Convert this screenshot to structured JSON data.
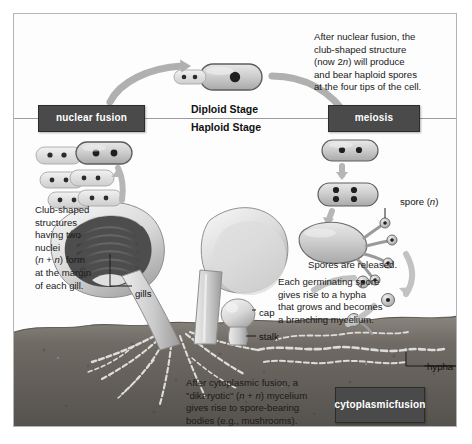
{
  "figure": {
    "frame_color": "#b4b4b4",
    "box_color": "#4a4a4a",
    "soil_color": "#6e6a66"
  },
  "stages": {
    "diploid": "Diploid Stage",
    "haploid": "Haploid Stage"
  },
  "boxes": {
    "nuclear_fusion": "nuclear fusion",
    "meiosis": "meiosis",
    "cytoplasmic_fusion_line1": "cytoplasmic",
    "cytoplasmic_fusion_line2": "fusion"
  },
  "captions": {
    "nuclear_fusion": "After nuclear fusion, the\nclub-shaped structure\n(now 2n) will produce\nand bear haploid spores\nat the four tips of the cell.",
    "club_shaped": "Club-shaped\nstructures\nhaving two\nnuclei\n(n + n) form\nat the margin\nof each gill.",
    "spores_released": "Spores are released.",
    "germinating_spore": "Each germinating spore\ngives rise to a hypha\nthat grows and becomes\na  branching mycelium.",
    "cytoplasmic_fusion": "After cytoplasmic fusion, a\n\"dikaryotic\" (n + n) mycelium\ngives rise to spore-bearing\nbodies (e.g., mushrooms)."
  },
  "labels": {
    "gills": "gills",
    "cap": "cap",
    "stalk": "stalk",
    "spore": "spore (n)",
    "hypha": "hypha"
  },
  "icons": {
    "arrow_nuclear_fusion": "curved-arrow-icon",
    "arrow_meiosis": "curved-arrow-icon",
    "arrow_spore_release": "curved-arrow-icon",
    "mushroom": "mushroom-icon",
    "mycelium": "mycelium-icon"
  }
}
